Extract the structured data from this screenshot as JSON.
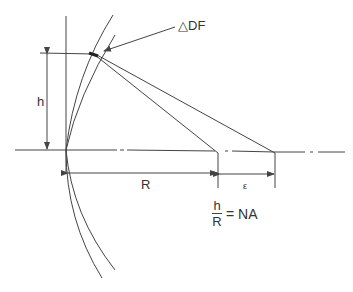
{
  "diagram": {
    "labels": {
      "delta_df": "△DF",
      "h": "h",
      "R": "R",
      "epsilon": "ε",
      "formula_numerator": "h",
      "formula_denominator": "R",
      "formula_rhs": "= NA"
    },
    "colors": {
      "stroke": "#444444",
      "background": "#ffffff"
    }
  }
}
